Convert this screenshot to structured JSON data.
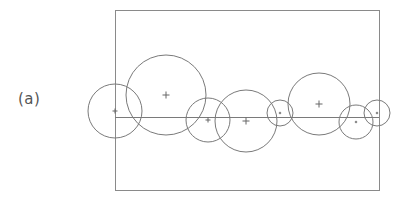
{
  "figure": {
    "panel_label": "(a)",
    "stroke_color": "#7a7a7a",
    "frame_color": "#8a8a8a",
    "frame": {
      "x": 115,
      "y": 10,
      "width": 264,
      "height": 180
    },
    "baseline": {
      "x1": 115,
      "y1": 117,
      "x2": 379,
      "y2": 117
    },
    "circles": [
      {
        "id": 1,
        "cx": 115,
        "cy": 111,
        "r": 27
      },
      {
        "id": 2,
        "cx": 166,
        "cy": 95,
        "r": 40
      },
      {
        "id": 3,
        "cx": 208,
        "cy": 120,
        "r": 22
      },
      {
        "id": 4,
        "cx": 246,
        "cy": 121,
        "r": 31
      },
      {
        "id": 5,
        "cx": 280,
        "cy": 113,
        "r": 13
      },
      {
        "id": 6,
        "cx": 319,
        "cy": 104,
        "r": 31
      },
      {
        "id": 7,
        "cx": 356,
        "cy": 122,
        "r": 17
      },
      {
        "id": 8,
        "cx": 377,
        "cy": 113,
        "r": 13
      }
    ]
  }
}
